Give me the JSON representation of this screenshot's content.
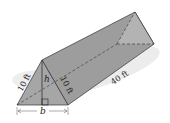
{
  "figure": {
    "type": "triangular-prism",
    "labels": {
      "left_slant": "10 ft",
      "right_slant": "10 ft",
      "length": "40 ft",
      "height": "h",
      "base": "b"
    },
    "colors": {
      "face_dark": "#8e8e8e",
      "face_mid": "#a8a8a8",
      "face_light": "#bdbdbd",
      "shadow": "#e4e4e4",
      "edge": "#333333"
    }
  }
}
